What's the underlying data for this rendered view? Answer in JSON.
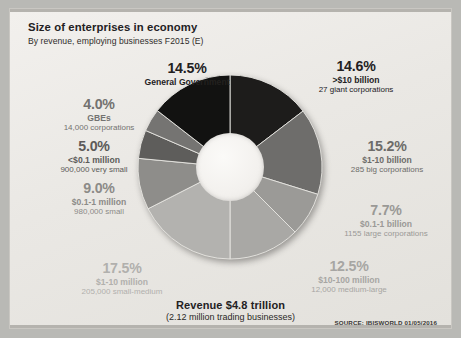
{
  "header": {
    "title": "Size of enterprises in economy",
    "subtitle": "By revenue, employing businesses F2015 (E)"
  },
  "footer": {
    "revenue": "Revenue $4.8 trillion",
    "revenue_sub": "(2.12 million trading businesses)",
    "source": "SOURCE: IBISWORLD 01/05/2016"
  },
  "labels": {
    "gov": {
      "pct": "14.5%",
      "line1": "General Government",
      "line2": ""
    },
    "giant": {
      "pct": "14.6%",
      "line1": ">$10 billion",
      "line2": "27 giant corporations"
    },
    "big": {
      "pct": "15.2%",
      "line1": "$1-10 billion",
      "line2": "285 big corporations"
    },
    "large": {
      "pct": "7.7%",
      "line1": "$0.1-1 billion",
      "line2": "1155 large corporations"
    },
    "medlarge": {
      "pct": "12.5%",
      "line1": "$10-100 million",
      "line2": "12,000 medium-large"
    },
    "smallmed": {
      "pct": "17.5%",
      "line1": "$1-10 million",
      "line2": "205,000 small-medium"
    },
    "small": {
      "pct": "9.0%",
      "line1": "$0.1-1 million",
      "line2": "980,000 small"
    },
    "verysmall": {
      "pct": "5.0%",
      "line1": "<$0.1 million",
      "line2": "900,000 very small"
    },
    "gbes": {
      "pct": "4.0%",
      "line1": "GBEs",
      "line2": "14,000 corporations"
    }
  },
  "chart_data": {
    "type": "pie",
    "title": "Size of enterprises in economy",
    "subtitle": "By revenue, employing businesses F2015 (E)",
    "total_label": "Revenue $4.8 trillion",
    "total_sub": "(2.12 million trading businesses)",
    "donut": true,
    "hole_ratio": 0.36,
    "start_angle_deg": 0,
    "direction": "clockwise",
    "legend": "callout-labels",
    "categories": [
      ">$10 billion",
      "$1-10 billion",
      "$0.1-1 billion",
      "$10-100 million",
      "$1-10 million",
      "$0.1-1 million",
      "<$0.1 million",
      "GBEs",
      "General Government"
    ],
    "values": [
      14.6,
      15.2,
      7.7,
      12.5,
      17.5,
      9.0,
      5.0,
      4.0,
      14.5
    ],
    "counts": [
      "27 giant corporations",
      "285 big corporations",
      "1155 large corporations",
      "12,000 medium-large",
      "205,000 small-medium",
      "980,000 small",
      "900,000 very small",
      "14,000 corporations",
      ""
    ],
    "colors": [
      "#1d1c1b",
      "#6e6d6b",
      "#9b9a97",
      "#a9a8a5",
      "#b3b2af",
      "#8e8d8a",
      "#5e5d5b",
      "#757472",
      "#121211"
    ],
    "label_colors": [
      "#23211f",
      "#6d6c69",
      "#9a9996",
      "#a7a6a3",
      "#b1b0ad",
      "#8c8b88",
      "#5c5b59",
      "#737270",
      "#23211f"
    ],
    "ylabel": "",
    "xlabel": ""
  }
}
